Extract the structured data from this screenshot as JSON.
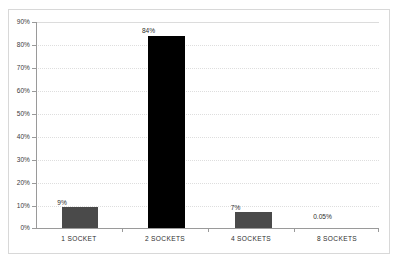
{
  "chart_data": {
    "type": "bar",
    "title": "",
    "subtitle": "",
    "xlabel": "",
    "ylabel": "",
    "categories": [
      "1 SOCKET",
      "2 SOCKETS",
      "4 SOCKETS",
      "8 SOCKETS"
    ],
    "values": [
      9,
      84,
      7,
      0.05
    ],
    "data_labels": [
      "9%",
      "84%",
      "7%",
      "0.05%"
    ],
    "series": [
      {
        "name": "Share",
        "values": [
          9,
          84,
          7,
          0.05
        ]
      }
    ],
    "ylim": [
      0,
      90
    ],
    "ytick_values": [
      0,
      10,
      20,
      30,
      40,
      50,
      60,
      70,
      80,
      90
    ],
    "ytick_labels": [
      "0%",
      "10%",
      "20%",
      "30%",
      "40%",
      "50%",
      "60%",
      "70%",
      "80%",
      "90%"
    ],
    "grid": true,
    "legend": false,
    "legend_position": "none",
    "bar_colors": [
      "#4a4a4a",
      "#000000",
      "#4a4a4a",
      "#4a4a4a"
    ],
    "axis_color": "#9a9a9a",
    "grid_color": "#dedede",
    "background_color": "#ffffff",
    "frame_color": "#d8d8d8"
  }
}
